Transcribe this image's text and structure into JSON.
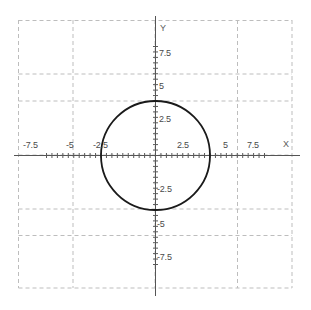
{
  "chart_data": {
    "type": "line",
    "title": "",
    "xlabel": "X",
    "ylabel": "Y",
    "xlim": [
      -10,
      10
    ],
    "ylim": [
      -10,
      10
    ],
    "grid": true,
    "grid_spacing": 5,
    "grid_style": "dashed",
    "legend": "none",
    "axis_color": "#555555",
    "grid_color": "#bdbdbd",
    "curve_color": "#1a1a1a",
    "background_color": "#ffffff",
    "x_ticks": [
      -7.5,
      -5,
      -2.5,
      2.5,
      5,
      7.5
    ],
    "x_tick_labels": [
      "-7.5",
      "-5",
      "-2.5",
      "2.5",
      "5",
      "7.5"
    ],
    "y_ticks": [
      7.5,
      5,
      2.5,
      -2.5,
      -5,
      -7.5
    ],
    "y_tick_labels": [
      "7.5",
      "5",
      "2.5",
      "-2.5",
      "-5",
      "-7.5"
    ],
    "minor_tick_spacing": 0.5,
    "series": [
      {
        "name": "circle",
        "shape": "circle",
        "center_x": 0,
        "center_y": 0,
        "radius": 5,
        "equation": "x^2 + y^2 = 25",
        "intercepts": {
          "x": [
            -5,
            5
          ],
          "y": [
            -5,
            5
          ]
        }
      }
    ]
  },
  "labels": {
    "axis_x": "X",
    "axis_y": "Y",
    "x_neg_75": "-7.5",
    "x_neg_5": "-5",
    "x_neg_25": "-2.5",
    "x_pos_25": "2.5",
    "x_pos_5": "5",
    "x_pos_75": "7.5",
    "y_pos_75": "7.5",
    "y_pos_5": "5",
    "y_pos_25": "2.5",
    "y_neg_25": "-2.5",
    "y_neg_5": "-5",
    "y_neg_75": "-7.5"
  }
}
